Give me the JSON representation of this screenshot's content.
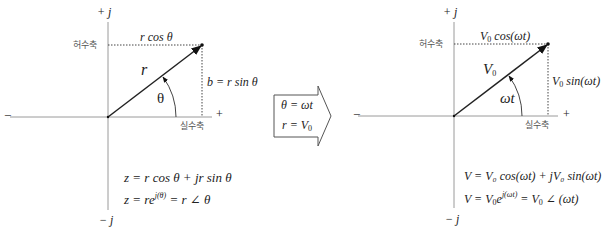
{
  "left_diagram": {
    "axis_pos_imag": "+ j",
    "axis_neg_imag": "− j",
    "axis_neg_real": "−",
    "axis_pos_real": "+",
    "imag_axis_label": "허수축",
    "real_axis_label": "실수축",
    "horizontal_projection": "r cos θ",
    "vertical_projection": "b = r sin θ",
    "vector_label": "r",
    "angle_label": "θ",
    "equation_1": "z = r cos θ +  jr sin θ",
    "equation_2_prefix": "z = re",
    "equation_2_exp": "j(θ)",
    "equation_2_suffix": " = r ∠ θ"
  },
  "transform_arrow": {
    "line_1": "θ = ωt",
    "line_2_prefix": "r = V",
    "line_2_sub": "0"
  },
  "right_diagram": {
    "axis_pos_imag": "+ j",
    "axis_neg_imag": "− j",
    "axis_neg_real": "−",
    "axis_pos_real": "+",
    "imag_axis_label": "허수축",
    "real_axis_label": "실수축",
    "horizontal_projection_prefix": "V",
    "horizontal_projection_sub": "0",
    "horizontal_projection_suffix": " cos(ωt)",
    "vertical_projection_prefix": "V",
    "vertical_projection_sub": "0",
    "vertical_projection_suffix": " sin(ωt)",
    "vector_label_prefix": "V",
    "vector_label_sub": "0",
    "angle_label": "ωt",
    "equation_1": "V = V₀ cos(ωt) + jV₀ sin(ωt)",
    "equation_2_prefix": "V = V",
    "equation_2_sub": "0",
    "equation_2_e": "e",
    "equation_2_exp": "j(ωt)",
    "equation_2_mid": " = V",
    "equation_2_sub2": "0",
    "equation_2_suffix": " ∠ (ωt)"
  },
  "colors": {
    "axis": "#9a9a9a",
    "vector": "#222222",
    "dotted": "#444444",
    "arrow_box": "#555555"
  }
}
